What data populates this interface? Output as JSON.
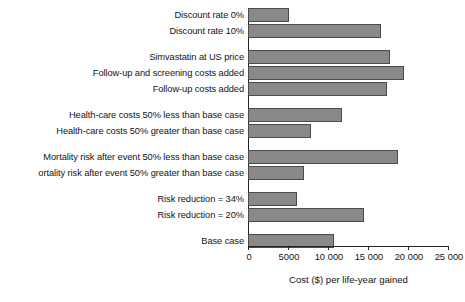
{
  "chart_data": {
    "type": "bar",
    "orientation": "horizontal",
    "title": "",
    "xlabel": "Cost ($) per life-year gained",
    "ylabel": "",
    "xlim": [
      0,
      25000
    ],
    "xticks": [
      0,
      5000,
      10000,
      15000,
      20000,
      25000
    ],
    "xticklabels": [
      "0",
      "5000",
      "10 000",
      "15 000",
      "20 000",
      "25 000"
    ],
    "grid": false,
    "legend": null,
    "bar_color": "#898989",
    "bar_edge_color": "#4a4a4a",
    "axis_color": "#232323",
    "categories": [
      "Discount rate 0%",
      "Discount rate 10%",
      "Simvastatin at US price",
      "Follow-up and screening costs added",
      "Follow-up costs added",
      "Health-care costs 50% less than base case",
      "Health-care costs 50% greater than base case",
      "Mortality risk after event 50% less than base case",
      "ortality risk after event 50% greater than base case",
      "Risk reduction = 34%",
      "Risk reduction = 20%",
      "Base case"
    ],
    "values": [
      5000,
      16500,
      17600,
      19400,
      17250,
      11600,
      7750,
      18600,
      6900,
      6000,
      14400,
      10600
    ],
    "groups": [
      {
        "label": "Discount rate",
        "categories": [
          "Discount rate 0%",
          "Discount rate 10%"
        ]
      },
      {
        "label": "Costs",
        "categories": [
          "Simvastatin at US price",
          "Follow-up and screening costs added",
          "Follow-up costs added"
        ]
      },
      {
        "label": "Health-care costs",
        "categories": [
          "Health-care costs 50% less than base case",
          "Health-care costs 50% greater than base case"
        ]
      },
      {
        "label": "Mortality risk",
        "categories": [
          "Mortality risk after event 50% less than base case",
          "ortality risk after event 50% greater than base case"
        ]
      },
      {
        "label": "Risk reduction",
        "categories": [
          "Risk reduction = 34%",
          "Risk reduction = 20%"
        ]
      },
      {
        "label": "Base",
        "categories": [
          "Base case"
        ]
      }
    ]
  },
  "bars": [
    {
      "label": "Discount rate 0%",
      "value": 5000
    },
    {
      "label": "Discount rate 10%",
      "value": 16500
    },
    {
      "label": "Simvastatin at US price",
      "value": 17600
    },
    {
      "label": "Follow-up and screening costs added",
      "value": 19400
    },
    {
      "label": "Follow-up costs added",
      "value": 17250
    },
    {
      "label": "Health-care costs 50% less than base case",
      "value": 11600
    },
    {
      "label": "Health-care costs 50% greater than base case",
      "value": 7750
    },
    {
      "label": "Mortality risk after event 50% less than base case",
      "value": 18600
    },
    {
      "label": "ortality risk after event 50% greater than base case",
      "value": 6900
    },
    {
      "label": "Risk reduction = 34%",
      "value": 6000
    },
    {
      "label": "Risk reduction = 20%",
      "value": 14400
    },
    {
      "label": "Base case",
      "value": 10600
    }
  ],
  "ticks": [
    {
      "value": 0,
      "label": "0"
    },
    {
      "value": 5000,
      "label": "5000"
    },
    {
      "value": 10000,
      "label": "10 000"
    },
    {
      "value": 15000,
      "label": "15 000"
    },
    {
      "value": 20000,
      "label": "20 000"
    },
    {
      "value": 25000,
      "label": "25 000"
    }
  ],
  "axis": {
    "title": "Cost ($) per life-year gained"
  }
}
